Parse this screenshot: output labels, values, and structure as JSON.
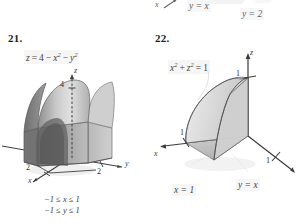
{
  "page": {
    "background": "#ffffff",
    "ink": "#3a3a3a"
  },
  "top_cut_figure": {
    "note": "partially cropped figure from previous exercise at top edge",
    "labels": [
      {
        "text": "x",
        "kind": "axis-label"
      },
      {
        "text": "y = x",
        "kind": "math-label"
      },
      {
        "text": "y = 2",
        "kind": "math-label"
      }
    ]
  },
  "exercises": [
    {
      "number": "21.",
      "equation_label": "z = 4 − x² − y²",
      "equation_parts": {
        "lhs": "z",
        "eq": "=",
        "term1": "4",
        "minus1": "−",
        "term2_base": "x",
        "term2_exp": "2",
        "minus2": "−",
        "term3_base": "y",
        "term3_exp": "2"
      },
      "axes": [
        {
          "name": "z",
          "label": "z",
          "tick": "4"
        },
        {
          "name": "y",
          "label": "y",
          "tick": "2"
        },
        {
          "name": "x",
          "label": "x",
          "tick": "2"
        }
      ],
      "constraints": [
        "−1 ≤ x ≤ 1",
        "−1 ≤ y ≤ 1"
      ],
      "solid": {
        "description": "paraboloid-capped square column",
        "fill_light": "#d8d8d8",
        "fill_mid": "#b6b6b6",
        "fill_dark": "#8e8e8e",
        "fill_darkest": "#6e6e6e",
        "stroke": "#4a4a4a"
      }
    },
    {
      "number": "22.",
      "equation_label": "x² + z² = 1",
      "equation_parts": {
        "t1_base": "x",
        "t1_exp": "2",
        "plus": "+",
        "t2_base": "z",
        "t2_exp": "2",
        "eq": "=",
        "rhs": "1"
      },
      "axes": [
        {
          "name": "z",
          "label": "z",
          "tick": "1"
        },
        {
          "name": "x",
          "label": "x",
          "tick": "1"
        },
        {
          "name": "y",
          "label": "y",
          "tick": "1"
        }
      ],
      "plane_labels": [
        "x = 1",
        "y = x"
      ],
      "solid": {
        "description": "quarter cylinder wedge cut by plane y = x",
        "fill_light": "#e2e2e2",
        "fill_mid": "#cfcfcf",
        "fill_dark": "#bcbcbc",
        "stroke": "#5a5a5a"
      }
    }
  ]
}
